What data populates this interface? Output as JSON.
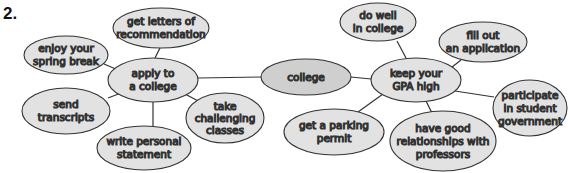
{
  "exercise_number": "2.",
  "colors": {
    "node_fill": "#e2e2e2",
    "center_fill": "#cfcfcf",
    "stroke": "#333333",
    "line": "#333333"
  },
  "diagram": {
    "center": {
      "id": "college",
      "lines": [
        "college"
      ]
    },
    "branches": [
      {
        "id": "apply",
        "lines": [
          "apply to",
          "a college"
        ],
        "children": [
          {
            "id": "letters",
            "lines": [
              "get letters of",
              "recommendation"
            ]
          },
          {
            "id": "spring",
            "lines": [
              "enjoy your",
              "spring break"
            ]
          },
          {
            "id": "transcripts",
            "lines": [
              "send",
              "transcripts"
            ]
          },
          {
            "id": "statement",
            "lines": [
              "write personal",
              "statement"
            ]
          },
          {
            "id": "classes",
            "lines": [
              "take",
              "challenging",
              "classes"
            ]
          }
        ]
      },
      {
        "id": "gpa",
        "lines": [
          "keep your",
          "GPA high"
        ],
        "children": [
          {
            "id": "dowell",
            "lines": [
              "do well",
              "in college"
            ]
          },
          {
            "id": "fillout",
            "lines": [
              "fill out",
              "an application"
            ]
          },
          {
            "id": "government",
            "lines": [
              "participate",
              "in student",
              "government"
            ]
          },
          {
            "id": "professors",
            "lines": [
              "have good",
              "relationships with",
              "professors"
            ]
          },
          {
            "id": "parking",
            "lines": [
              "get a parking",
              "permit"
            ]
          }
        ]
      }
    ]
  },
  "text": {
    "college": "college",
    "apply_1": "apply to",
    "apply_2": "a college",
    "gpa_1": "keep your",
    "gpa_2": "GPA high",
    "letters_1": "get letters of",
    "letters_2": "recommendation",
    "spring_1": "enjoy your",
    "spring_2": "spring break",
    "transcripts_1": "send",
    "transcripts_2": "transcripts",
    "statement_1": "write personal",
    "statement_2": "statement",
    "classes_1": "take",
    "classes_2": "challenging",
    "classes_3": "classes",
    "dowell_1": "do well",
    "dowell_2": "in college",
    "fillout_1": "fill out",
    "fillout_2": "an application",
    "government_1": "participate",
    "government_2": "in student",
    "government_3": "government",
    "professors_1": "have good",
    "professors_2": "relationships with",
    "professors_3": "professors",
    "parking_1": "get a parking",
    "parking_2": "permit"
  }
}
